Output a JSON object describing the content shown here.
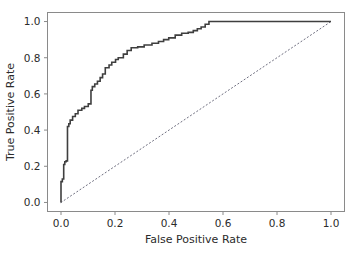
{
  "figure": {
    "background_color": "#ffffff",
    "width": 360,
    "height": 253
  },
  "axes": {
    "spine_color": "#7a7a7a",
    "tick_color": "#7a7a7a",
    "text_color": "#2b2b2b",
    "xlabel": "False Positive Rate",
    "ylabel": "True Positive Rate",
    "xticklabels": [
      "0.0",
      "0.2",
      "0.4",
      "0.6",
      "0.8",
      "1.0"
    ],
    "yticklabels": [
      "0.0",
      "0.2",
      "0.4",
      "0.6",
      "0.8",
      "1.0"
    ]
  },
  "chart_data": {
    "type": "line",
    "title": "",
    "xlabel": "False Positive Rate",
    "ylabel": "True Positive Rate",
    "xlim": [
      -0.05,
      1.05
    ],
    "ylim": [
      -0.05,
      1.05
    ],
    "xticks": [
      0.0,
      0.2,
      0.4,
      0.6,
      0.8,
      1.0
    ],
    "yticks": [
      0.0,
      0.2,
      0.4,
      0.6,
      0.8,
      1.0
    ],
    "grid": false,
    "legend": null,
    "series": [
      {
        "name": "ROC curve",
        "style": "solid",
        "color": "#3f3f3f",
        "linewidth": 1.6,
        "drawstyle": "steps-post",
        "x": [
          0.0,
          0.0,
          0.0,
          0.005,
          0.005,
          0.01,
          0.01,
          0.014,
          0.014,
          0.019,
          0.019,
          0.024,
          0.024,
          0.029,
          0.029,
          0.034,
          0.034,
          0.043,
          0.043,
          0.053,
          0.053,
          0.063,
          0.063,
          0.077,
          0.077,
          0.087,
          0.087,
          0.101,
          0.101,
          0.111,
          0.111,
          0.116,
          0.116,
          0.125,
          0.125,
          0.135,
          0.135,
          0.145,
          0.145,
          0.154,
          0.154,
          0.164,
          0.164,
          0.178,
          0.178,
          0.188,
          0.188,
          0.202,
          0.202,
          0.212,
          0.212,
          0.231,
          0.231,
          0.245,
          0.245,
          0.26,
          0.26,
          0.284,
          0.284,
          0.308,
          0.308,
          0.337,
          0.337,
          0.361,
          0.361,
          0.38,
          0.38,
          0.399,
          0.399,
          0.423,
          0.423,
          0.447,
          0.447,
          0.471,
          0.471,
          0.49,
          0.49,
          0.505,
          0.505,
          0.519,
          0.519,
          0.534,
          0.534,
          0.548,
          0.548,
          1.0
        ],
        "y": [
          0.0,
          0.02,
          0.115,
          0.115,
          0.13,
          0.13,
          0.21,
          0.21,
          0.225,
          0.225,
          0.23,
          0.23,
          0.42,
          0.42,
          0.435,
          0.435,
          0.455,
          0.455,
          0.475,
          0.475,
          0.49,
          0.49,
          0.51,
          0.51,
          0.52,
          0.52,
          0.53,
          0.53,
          0.545,
          0.545,
          0.62,
          0.62,
          0.64,
          0.64,
          0.655,
          0.655,
          0.67,
          0.67,
          0.69,
          0.69,
          0.71,
          0.71,
          0.745,
          0.745,
          0.76,
          0.76,
          0.775,
          0.775,
          0.79,
          0.79,
          0.8,
          0.8,
          0.82,
          0.82,
          0.84,
          0.84,
          0.855,
          0.855,
          0.86,
          0.86,
          0.87,
          0.87,
          0.88,
          0.88,
          0.89,
          0.89,
          0.9,
          0.9,
          0.91,
          0.91,
          0.925,
          0.925,
          0.935,
          0.935,
          0.94,
          0.94,
          0.95,
          0.95,
          0.96,
          0.96,
          0.97,
          0.97,
          0.985,
          0.985,
          1.0,
          1.0
        ]
      },
      {
        "name": "chance diagonal",
        "style": "dotted",
        "color": "#6f6f80",
        "linewidth": 1.0,
        "x": [
          0.0,
          1.0
        ],
        "y": [
          0.0,
          1.0
        ]
      }
    ]
  }
}
